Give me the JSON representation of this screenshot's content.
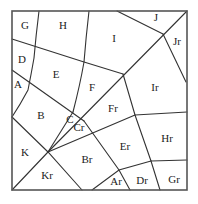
{
  "diagram": {
    "type": "polygon-partition",
    "frame": {
      "x": 12,
      "y": 11,
      "width": 175,
      "height": 179
    },
    "colors": {
      "line": "#333333",
      "frame": "#555555",
      "text": "#222222",
      "background": "#ffffff"
    },
    "labels": [
      {
        "id": "G",
        "text": "G",
        "x": 25,
        "y": 26
      },
      {
        "id": "H",
        "text": "H",
        "x": 63,
        "y": 26
      },
      {
        "id": "I",
        "text": "I",
        "x": 114,
        "y": 39
      },
      {
        "id": "J",
        "text": "J",
        "x": 156,
        "y": 18
      },
      {
        "id": "Jr",
        "text": "Jr",
        "x": 177,
        "y": 42
      },
      {
        "id": "D",
        "text": "D",
        "x": 22,
        "y": 60
      },
      {
        "id": "E",
        "text": "E",
        "x": 56,
        "y": 75
      },
      {
        "id": "A",
        "text": "A",
        "x": 18,
        "y": 85
      },
      {
        "id": "F",
        "text": "F",
        "x": 92,
        "y": 88
      },
      {
        "id": "Ir",
        "text": "Ir",
        "x": 155,
        "y": 88
      },
      {
        "id": "B",
        "text": "B",
        "x": 41,
        "y": 116
      },
      {
        "id": "Fr",
        "text": "Fr",
        "x": 113,
        "y": 109
      },
      {
        "id": "C",
        "text": "C",
        "x": 70,
        "y": 120
      },
      {
        "id": "Cr",
        "text": "Cr",
        "x": 79,
        "y": 128
      },
      {
        "id": "K",
        "text": "K",
        "x": 25,
        "y": 153
      },
      {
        "id": "Er",
        "text": "Er",
        "x": 125,
        "y": 147
      },
      {
        "id": "Hr",
        "text": "Hr",
        "x": 167,
        "y": 139
      },
      {
        "id": "Br",
        "text": "Br",
        "x": 87,
        "y": 160
      },
      {
        "id": "Kr",
        "text": "Kr",
        "x": 47,
        "y": 176
      },
      {
        "id": "Ar",
        "text": "Ar",
        "x": 116,
        "y": 182
      },
      {
        "id": "Dr",
        "text": "Dr",
        "x": 142,
        "y": 181
      },
      {
        "id": "Gr",
        "text": "Gr",
        "x": 174,
        "y": 180
      }
    ],
    "edges": [
      {
        "id": "gh",
        "d": "M39,11 Q36,35 34,58 Q31,75 28,90 Q20,105 12,117"
      },
      {
        "id": "hi",
        "d": "M89,11 Q86,37 84,62 Q80,85 73,112"
      },
      {
        "id": "ij",
        "d": "M117,11 L163,34"
      },
      {
        "id": "diag",
        "d": "M187,11 L48,152"
      },
      {
        "id": "jr",
        "d": "M163,34 L186,82"
      },
      {
        "id": "gd",
        "d": "M12,39 L84,62 L123,74"
      },
      {
        "id": "da",
        "d": "M12,70 L84,121"
      },
      {
        "id": "fir",
        "d": "M123,74 L135,115 L151,161 L160,190"
      },
      {
        "id": "hrtop",
        "d": "M135,115 L187,112"
      },
      {
        "id": "hrbot",
        "d": "M151,161 L187,160"
      },
      {
        "id": "frer",
        "d": "M48,152 L135,115"
      },
      {
        "id": "ck",
        "d": "M73,112 L48,152"
      },
      {
        "id": "crbr",
        "d": "M84,121 L119,170 L130,190"
      },
      {
        "id": "ardr",
        "d": "M92,190 L119,170 L151,161"
      },
      {
        "id": "kkr",
        "d": "M12,190 L48,152"
      },
      {
        "id": "kl",
        "d": "M12,117 L48,152 L82,190"
      }
    ]
  }
}
